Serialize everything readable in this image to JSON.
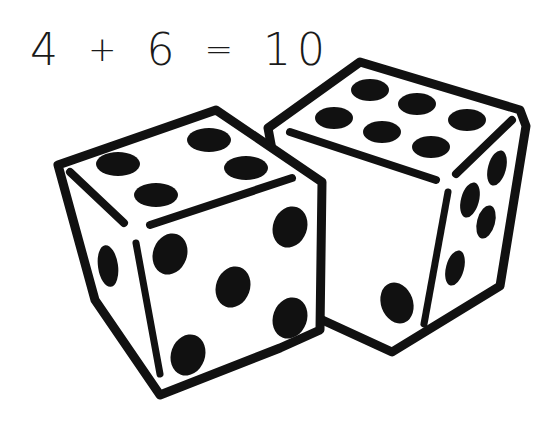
{
  "equation": {
    "left": "4",
    "plus": "+",
    "right": "6",
    "equals": "=",
    "result": "10"
  },
  "dice": [
    {
      "name": "left-die",
      "top_face": 4,
      "front_face": 5,
      "left_face": 2
    },
    {
      "name": "right-die",
      "top_face": 6,
      "front_face": 2,
      "right_face": 5
    }
  ],
  "colors": {
    "ink": "#111111",
    "paper": "#ffffff"
  }
}
